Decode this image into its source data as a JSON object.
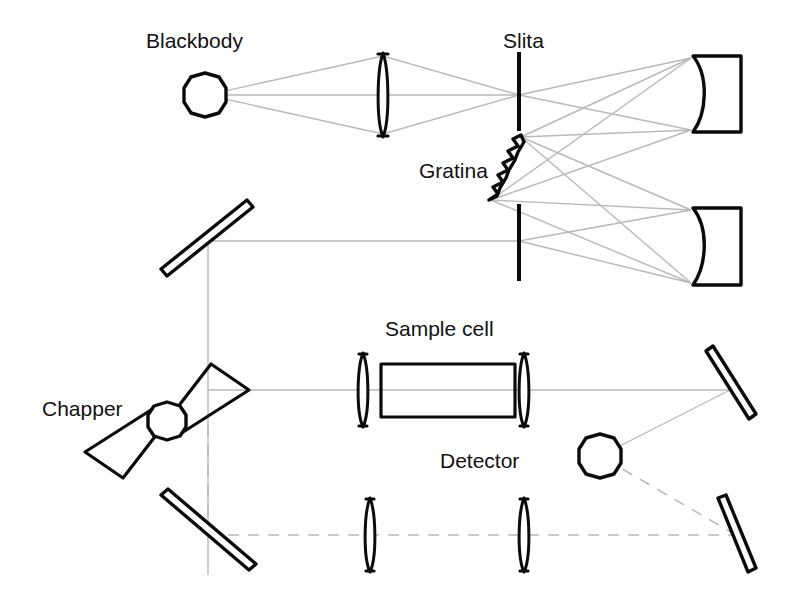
{
  "figure": {
    "background_color": "#ffffff",
    "ink_color": "#0b0b0b",
    "ray_color": "#b9b9b9",
    "width": 789,
    "height": 607
  },
  "labels": {
    "blackbody": "Blackbody",
    "slit": "Slita",
    "grating": "Gratina",
    "chopper": "Chapper",
    "sample_cell": "Sample cell",
    "detector": "Detector"
  },
  "label_positions": {
    "blackbody": {
      "x": 146,
      "y": 48
    },
    "slit": {
      "x": 503,
      "y": 48
    },
    "grating": {
      "x": 419,
      "y": 178
    },
    "chopper": {
      "x": 42,
      "y": 416
    },
    "sample_cell": {
      "x": 385,
      "y": 336
    },
    "detector": {
      "x": 440,
      "y": 468
    }
  },
  "components": [
    {
      "name": "blackbody-source",
      "type": "circle",
      "cx": 205,
      "cy": 95,
      "r": 22
    },
    {
      "name": "source-lens",
      "type": "lens",
      "cx": 383,
      "cy": 95,
      "half_height": 42
    },
    {
      "name": "entrance-slit",
      "type": "slit",
      "x": 519,
      "y_top": 52,
      "y_bottom": 131
    },
    {
      "name": "upper-collimating-mirror",
      "type": "concave-mirror",
      "x": 693,
      "y_top": 56,
      "y_bottom": 132
    },
    {
      "name": "diffraction-grating",
      "type": "grating",
      "x1": 489,
      "y1": 202,
      "x2": 521,
      "y2": 135,
      "teeth": 7
    },
    {
      "name": "lower-focusing-mirror",
      "type": "concave-mirror",
      "x": 693,
      "y_top": 208,
      "y_bottom": 285
    },
    {
      "name": "exit-slit",
      "type": "slit",
      "x": 519,
      "y_top": 204,
      "y_bottom": 281
    },
    {
      "name": "fold-mirror-upper-left",
      "type": "flat-mirror",
      "x1": 163,
      "y1": 272,
      "x2": 250,
      "y2": 203
    },
    {
      "name": "chopper-wheel",
      "type": "chopper",
      "cx": 167,
      "cy": 421,
      "hub_r": 19
    },
    {
      "name": "sample-cell-input-lens",
      "type": "lens",
      "cx": 363,
      "cy": 390,
      "half_height": 37
    },
    {
      "name": "sample-cell-body",
      "type": "rect",
      "x": 381,
      "y": 364,
      "width": 134,
      "height": 53
    },
    {
      "name": "sample-cell-output-lens",
      "type": "lens",
      "cx": 524,
      "cy": 390,
      "half_height": 37
    },
    {
      "name": "fold-mirror-right-upper",
      "type": "flat-mirror",
      "x1": 709,
      "y1": 353,
      "x2": 752,
      "y2": 417
    },
    {
      "name": "detector-element",
      "type": "circle",
      "cx": 600,
      "cy": 456,
      "r": 22
    },
    {
      "name": "fold-mirror-lower-left",
      "type": "flat-mirror",
      "x1": 164,
      "y1": 498,
      "x2": 253,
      "y2": 567
    },
    {
      "name": "reference-lens-left",
      "type": "lens",
      "cx": 370,
      "cy": 535,
      "half_height": 37
    },
    {
      "name": "reference-lens-right",
      "type": "lens",
      "cx": 524,
      "cy": 535,
      "half_height": 37
    },
    {
      "name": "fold-mirror-right-lower",
      "type": "flat-mirror",
      "x1": 722,
      "y1": 500,
      "x2": 751,
      "y2": 571
    }
  ],
  "beam_paths": {
    "source_to_slit": "solid",
    "monochromator": "solid",
    "sample_beam": "solid",
    "reference_beam": "dashed"
  }
}
